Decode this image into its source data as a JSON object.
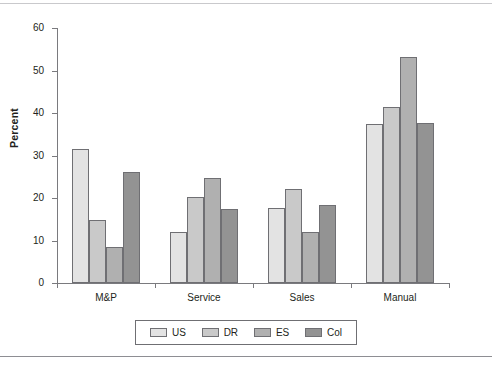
{
  "chart_data": {
    "type": "bar",
    "title": "",
    "subtitle": "",
    "xlabel": "",
    "ylabel": "Percent",
    "ylim": [
      0,
      60
    ],
    "yticks": [
      0,
      10,
      20,
      30,
      40,
      50,
      60
    ],
    "ytick_labels": [
      "0",
      "10",
      "20",
      "30",
      "40",
      "50",
      "60"
    ],
    "grid": false,
    "legend_position": "bottom",
    "categories": [
      "M&P",
      "Service",
      "Sales",
      "Manual"
    ],
    "series": [
      {
        "name": "US",
        "color": "#e3e3e3",
        "values": [
          31.6,
          12.0,
          17.7,
          37.4
        ]
      },
      {
        "name": "DR",
        "color": "#c9c9c9",
        "values": [
          14.9,
          20.3,
          22.1,
          41.5
        ]
      },
      {
        "name": "ES",
        "color": "#b0b0b0",
        "values": [
          8.4,
          24.6,
          11.9,
          53.2
        ]
      },
      {
        "name": "Col",
        "color": "#939393",
        "values": [
          26.1,
          17.5,
          18.3,
          37.6
        ]
      }
    ]
  },
  "axis": {
    "y_title": "Percent"
  },
  "legend": {
    "items": [
      {
        "label": "US"
      },
      {
        "label": "DR"
      },
      {
        "label": "ES"
      },
      {
        "label": "Col"
      }
    ]
  },
  "rules": {
    "top_color": "#c9c9cc",
    "bottom_color": "#8e8e93"
  }
}
